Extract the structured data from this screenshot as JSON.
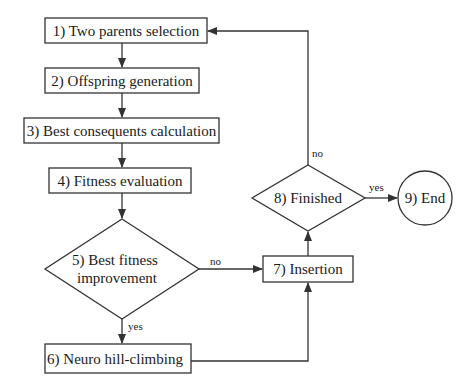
{
  "diagram": {
    "type": "flowchart",
    "nodes": [
      {
        "id": "n1",
        "shape": "rect",
        "label": "1) Two parents selection"
      },
      {
        "id": "n2",
        "shape": "rect",
        "label": "2) Offspring generation"
      },
      {
        "id": "n3",
        "shape": "rect",
        "label": "3) Best consequents calculation"
      },
      {
        "id": "n4",
        "shape": "rect",
        "label": "4) Fitness evaluation"
      },
      {
        "id": "n5",
        "shape": "diamond",
        "label_line1": "5) Best fitness",
        "label_line2": "improvement"
      },
      {
        "id": "n6",
        "shape": "rect",
        "label": "6) Neuro hill-climbing"
      },
      {
        "id": "n7",
        "shape": "rect",
        "label": "7) Insertion"
      },
      {
        "id": "n8",
        "shape": "diamond",
        "label": "8) Finished"
      },
      {
        "id": "n9",
        "shape": "circle",
        "label": "9) End"
      }
    ],
    "edges": [
      {
        "from": "n1",
        "to": "n2",
        "label": ""
      },
      {
        "from": "n2",
        "to": "n3",
        "label": ""
      },
      {
        "from": "n3",
        "to": "n4",
        "label": ""
      },
      {
        "from": "n4",
        "to": "n5",
        "label": ""
      },
      {
        "from": "n5",
        "to": "n6",
        "label": "yes"
      },
      {
        "from": "n5",
        "to": "n7",
        "label": "no"
      },
      {
        "from": "n6",
        "to": "n7",
        "label": ""
      },
      {
        "from": "n7",
        "to": "n8",
        "label": ""
      },
      {
        "from": "n8",
        "to": "n9",
        "label": "yes"
      },
      {
        "from": "n8",
        "to": "n1",
        "label": "no"
      }
    ]
  },
  "edge_labels": {
    "e5_6": "yes",
    "e5_7": "no",
    "e8_9": "yes",
    "e8_1": "no"
  },
  "colors": {
    "stroke": "#333333",
    "fill": "#ffffff",
    "text": "#1a1a1a"
  }
}
